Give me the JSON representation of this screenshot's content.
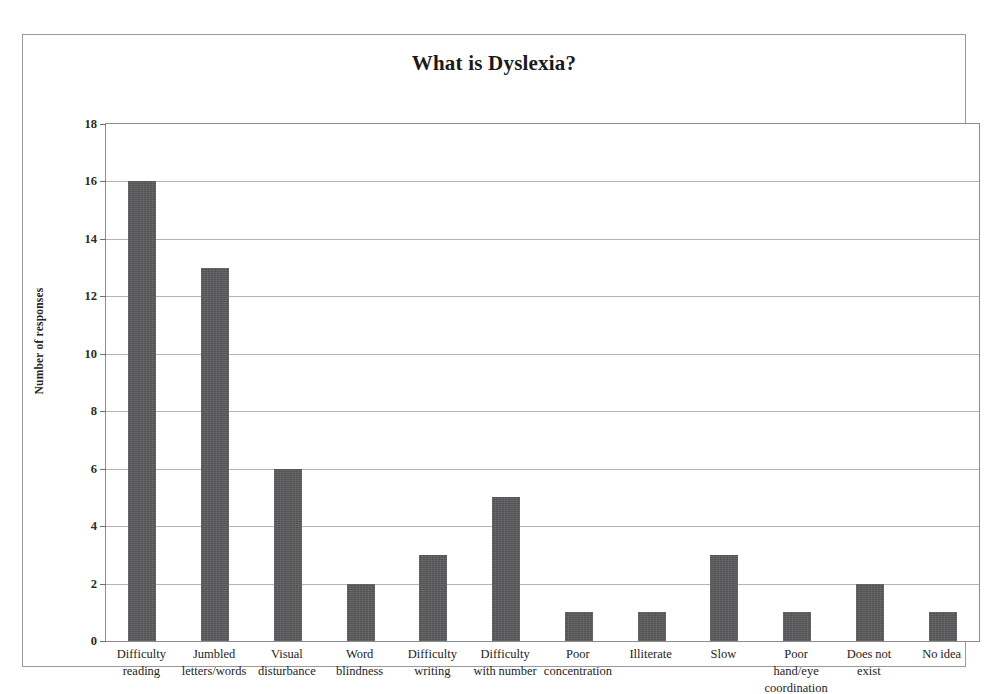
{
  "chart_data": {
    "type": "bar",
    "title": "What is Dyslexia?",
    "xlabel": "",
    "ylabel": "Number of responses",
    "ylim": [
      0,
      18
    ],
    "ytick_step": 2,
    "yticks": [
      18,
      16,
      14,
      12,
      10,
      8,
      6,
      4,
      2,
      0
    ],
    "grid": true,
    "legend": "none",
    "bar_color": "#59595b",
    "categories": [
      "Difficulty reading",
      "Jumbled letters/words",
      "Visual disturbance",
      "Word blindness",
      "Difficulty writing",
      "Difficulty with number",
      "Poor concentration",
      "Illiterate",
      "Slow",
      "Poor hand/eye coordination",
      "Does not exist",
      "No idea"
    ],
    "category_lines": [
      [
        "Difficulty",
        "reading"
      ],
      [
        "Jumbled",
        "letters/words"
      ],
      [
        "Visual",
        "disturbance"
      ],
      [
        "Word",
        "blindness"
      ],
      [
        "Difficulty",
        "writing"
      ],
      [
        "Difficulty",
        "with number"
      ],
      [
        "Poor",
        "concentration"
      ],
      [
        "Illiterate"
      ],
      [
        "Slow"
      ],
      [
        "Poor",
        "hand/eye",
        "coordination"
      ],
      [
        "Does not",
        "exist"
      ],
      [
        "No idea"
      ]
    ],
    "values": [
      16,
      13,
      6,
      2,
      3,
      5,
      1,
      1,
      3,
      1,
      2,
      1
    ]
  }
}
